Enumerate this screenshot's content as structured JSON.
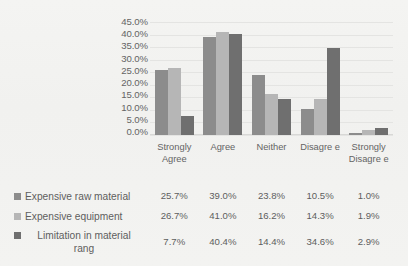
{
  "chart_data": {
    "type": "bar",
    "title": "",
    "subtitle": "",
    "xlabel": "",
    "ylabel": "",
    "ylim": [
      0,
      45
    ],
    "grid": true,
    "legend_position": "bottom-table",
    "categories": [
      "Strongly Agree",
      "Agree",
      "Neither",
      "Disagree",
      "Strongly Disagree"
    ],
    "category_labels_wrapped": [
      "Strongly Agree",
      "Agree",
      "Neither",
      "Disagre e",
      "Strongly Disagre e"
    ],
    "y_ticks": [
      "0.0%",
      "5.0%",
      "10.0%",
      "15.0%",
      "20.0%",
      "25.0%",
      "30.0%",
      "35.0%",
      "40.0%",
      "45.0%"
    ],
    "y_ticks_desc": [
      "45.0%",
      "40.0%",
      "35.0%",
      "30.0%",
      "25.0%",
      "20.0%",
      "15.0%",
      "10.0%",
      "5.0%",
      "0.0%"
    ],
    "series": [
      {
        "name": "Expensive raw material",
        "color": "#8c8c8c",
        "values": [
          25.7,
          39.0,
          23.8,
          10.5,
          1.0
        ],
        "labels": [
          "25.7%",
          "39.0%",
          "23.8%",
          "10.5%",
          "1.0%"
        ]
      },
      {
        "name": "Expensive equipment",
        "color": "#b6b6b6",
        "values": [
          26.7,
          41.0,
          16.2,
          14.3,
          1.9
        ],
        "labels": [
          "26.7%",
          "41.0%",
          "16.2%",
          "14.3%",
          "1.9%"
        ]
      },
      {
        "name": "Limitation in material rang",
        "name_line1": "Limitation in material",
        "name_line2": "rang",
        "color": "#6f6f6f",
        "values": [
          7.7,
          40.4,
          14.4,
          34.6,
          2.9
        ],
        "labels": [
          "7.7%",
          "40.4%",
          "14.4%",
          "34.6%",
          "2.9%"
        ]
      }
    ]
  },
  "axis": {
    "tick_45": "45.0%",
    "tick_40": "40.0%",
    "tick_35": "35.0%",
    "tick_30": "30.0%",
    "tick_25": "25.0%",
    "tick_20": "20.0%",
    "tick_15": "15.0%",
    "tick_10": "10.0%",
    "tick_5": "5.0%",
    "tick_0": "0.0%"
  },
  "x_categories": {
    "c0": "Strongly Agree",
    "c1": "Agree",
    "c2": "Neither",
    "c3": "Disagre e",
    "c4": "Strongly Disagre e"
  },
  "legend": {
    "row0_label": "Expensive raw material",
    "row1_label": "Expensive equipment",
    "row2_label_line1": "Limitation in material",
    "row2_label_line2": "rang",
    "row0_values": [
      "25.7%",
      "39.0%",
      "23.8%",
      "10.5%",
      "1.0%"
    ],
    "row1_values": [
      "26.7%",
      "41.0%",
      "16.2%",
      "14.3%",
      "1.9%"
    ],
    "row2_values": [
      "7.7%",
      "40.4%",
      "14.4%",
      "34.6%",
      "2.9%"
    ]
  },
  "colors": {
    "series_1": "#8c8c8c",
    "series_2": "#b6b6b6",
    "series_3": "#6f6f6f",
    "background": "#f2f2f0",
    "text": "#5e5e5e",
    "gridline": "#e4e4e2"
  }
}
